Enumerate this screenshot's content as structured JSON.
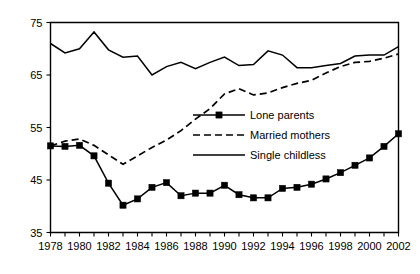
{
  "chart_data": {
    "type": "line",
    "title": "",
    "subtitle": "",
    "xlabel": "",
    "ylabel": "",
    "xlim": [
      1978,
      2002
    ],
    "ylim": [
      35,
      75
    ],
    "yticks": [
      35,
      45,
      55,
      65,
      75
    ],
    "xticks_labeled": [
      1978,
      1980,
      1982,
      1984,
      1986,
      1988,
      1990,
      1992,
      1994,
      1996,
      1998,
      2000,
      2002
    ],
    "xticks_all": [
      1978,
      1979,
      1980,
      1981,
      1982,
      1983,
      1984,
      1985,
      1986,
      1987,
      1988,
      1989,
      1990,
      1991,
      1992,
      1993,
      1994,
      1995,
      1996,
      1997,
      1998,
      1999,
      2000,
      2001,
      2002
    ],
    "grid": false,
    "legend_position": "center-right",
    "x": [
      1978,
      1979,
      1980,
      1981,
      1982,
      1983,
      1984,
      1985,
      1986,
      1987,
      1988,
      1989,
      1990,
      1991,
      1992,
      1993,
      1994,
      1995,
      1996,
      1997,
      1998,
      1999,
      2000,
      2001,
      2002
    ],
    "series": [
      {
        "name": "Lone parents",
        "style": "solid-with-markers",
        "marker": "square",
        "values": [
          51.5,
          51.4,
          51.6,
          49.6,
          44.4,
          40.2,
          41.4,
          43.6,
          44.5,
          42.0,
          42.5,
          42.5,
          44.0,
          42.2,
          41.6,
          41.6,
          43.4,
          43.6,
          44.2,
          45.2,
          46.4,
          47.8,
          49.2,
          51.4,
          53.8
        ]
      },
      {
        "name": "Married mothers",
        "style": "dashed",
        "marker": "none",
        "values": [
          51.5,
          52.4,
          52.8,
          51.6,
          49.8,
          48.0,
          49.6,
          51.2,
          52.6,
          54.4,
          56.6,
          58.6,
          61.4,
          62.4,
          61.2,
          61.6,
          62.6,
          63.4,
          64.0,
          65.4,
          66.6,
          67.4,
          67.6,
          68.2,
          69.0
        ]
      },
      {
        "name": "Single childless",
        "style": "solid",
        "marker": "none",
        "values": [
          71.0,
          69.2,
          70.0,
          73.2,
          69.8,
          68.4,
          68.6,
          65.0,
          66.6,
          67.4,
          66.2,
          67.4,
          68.4,
          66.8,
          67.0,
          69.6,
          68.8,
          66.4,
          66.4,
          66.8,
          67.2,
          68.6,
          68.8,
          68.8,
          70.4
        ]
      }
    ]
  },
  "legend": {
    "items": [
      {
        "label": "Lone parents",
        "style": "solid-with-markers"
      },
      {
        "label": "Married mothers",
        "style": "dashed"
      },
      {
        "label": "Single childless",
        "style": "solid"
      }
    ]
  },
  "axes": {
    "y_tick_labels": [
      "75",
      "65",
      "55",
      "45",
      "35"
    ],
    "x_tick_labels": [
      "1978",
      "1980",
      "1982",
      "1984",
      "1986",
      "1988",
      "1990",
      "1992",
      "1994",
      "1996",
      "1998",
      "2000",
      "2002"
    ]
  }
}
